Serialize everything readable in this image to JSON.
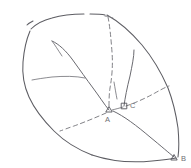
{
  "figure": {
    "background_color": "#ffffff",
    "line_color": "#5d5d63",
    "dash_color": "#7a7a80",
    "label_color": "#6e6e74"
  },
  "points": [
    {
      "id": "A",
      "label": "A",
      "marker": "triangle",
      "x": 109,
      "y": 110,
      "label_x": 108,
      "label_y": 119
    },
    {
      "id": "C",
      "label": "C",
      "marker": "square",
      "x": 124,
      "y": 106,
      "label_x": 131,
      "label_y": 105
    },
    {
      "id": "B",
      "label": "B",
      "marker": "triangle",
      "x": 174,
      "y": 158,
      "label_x": 181,
      "label_y": 159
    }
  ],
  "strokes": {
    "outline_left": "outer-boundary-left",
    "outline_top": "outer-boundary-top",
    "outline_right": "outer-boundary-right",
    "outline_bottom": "outer-boundary-bottom",
    "branch_main": "main-channel",
    "branch_upper": "upper-tributary",
    "branch_mid": "mid-tributary",
    "branch_right": "right-tributary",
    "divide_top": "dashed-divide-top",
    "divide_right": "dashed-divide-right",
    "divide_lower": "dashed-divide-lower"
  }
}
